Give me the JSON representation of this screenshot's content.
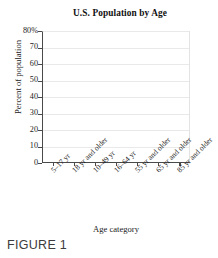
{
  "figure": {
    "caption": "FIGURE 1"
  },
  "chart_data": {
    "type": "bar",
    "title": "U.S. Population by Age",
    "xlabel": "Age category",
    "ylabel": "Percent of population",
    "categories": [
      "5–17 yr",
      "18 yr and older",
      "10–49 yr",
      "16–64 yr",
      "55 yr and older",
      "65 yr and older",
      "85 yr and older"
    ],
    "values": [
      null,
      null,
      null,
      null,
      null,
      null,
      null
    ],
    "ylim": [
      0,
      80
    ],
    "ytick_values": [
      80,
      70,
      60,
      50,
      40,
      30,
      20,
      10,
      0
    ],
    "ytick_labels": [
      "80%",
      "70",
      "60",
      "50",
      "40",
      "30",
      "20",
      "10",
      "0"
    ],
    "grid": true,
    "grid_axis": "y",
    "legend": false,
    "colors": {
      "axis": "#4a4a4a",
      "gridline": "#e9e9e9",
      "text": "#1a1a1a",
      "background": "#ffffff"
    }
  }
}
